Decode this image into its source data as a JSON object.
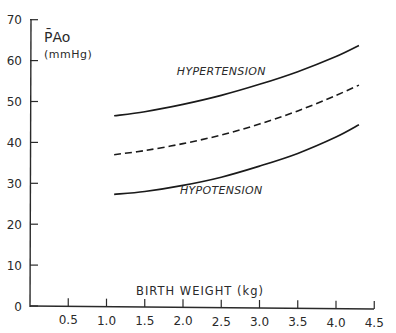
{
  "chart_data": {
    "type": "line",
    "title": "",
    "xlabel": "BIRTH WEIGHT (kg)",
    "ylabel": "P̄Ao",
    "ylabel_unit": "(mmHg)",
    "xlim": [
      0,
      4.5
    ],
    "ylim": [
      0,
      70
    ],
    "grid": false,
    "legend": "none (inline curve labels)",
    "x_ticks": [
      0.5,
      1.0,
      1.5,
      2.0,
      2.5,
      3.0,
      3.5,
      4.0,
      4.5
    ],
    "x_tick_labels": [
      "0.5",
      "1.0",
      "1.5",
      "2.0",
      "2.5",
      "3.0",
      "3.5",
      "4.0",
      "4.5"
    ],
    "y_ticks": [
      0,
      10,
      20,
      30,
      40,
      50,
      60,
      70
    ],
    "y_tick_labels": [
      "0",
      "10",
      "20",
      "30",
      "40",
      "50",
      "60",
      "70"
    ],
    "x": [
      1.1,
      1.5,
      2.0,
      2.5,
      3.0,
      3.5,
      4.0,
      4.3
    ],
    "series": [
      {
        "name": "HYPERTENSION",
        "style": "solid",
        "label": "HYPERTENSION",
        "values": [
          46.5,
          47.5,
          49.3,
          51.5,
          54.2,
          57.3,
          61.0,
          63.7
        ]
      },
      {
        "name": "Mean",
        "style": "dashed",
        "label": "",
        "values": [
          37.0,
          38.0,
          39.7,
          41.8,
          44.5,
          47.7,
          51.5,
          54.0
        ]
      },
      {
        "name": "HYPOTENSION",
        "style": "solid",
        "label": "HYPOTENSION",
        "values": [
          27.3,
          28.0,
          29.5,
          31.5,
          34.2,
          37.3,
          41.3,
          44.3
        ]
      }
    ],
    "annotations": [
      {
        "text": "HYPERTENSION",
        "x": 2.5,
        "y": 56.5
      },
      {
        "text": "HYPOTENSION",
        "x": 2.5,
        "y": 27.5
      }
    ]
  }
}
